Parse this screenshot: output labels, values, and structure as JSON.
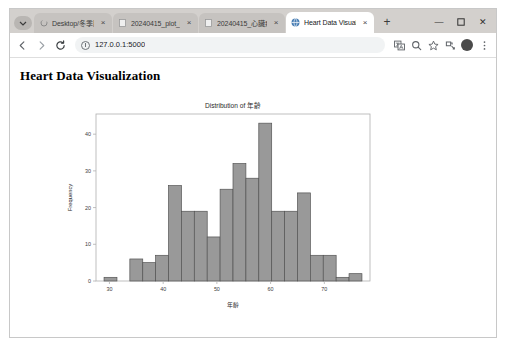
{
  "browser": {
    "tab_search_icon": "chevron-down-icon",
    "tabs": [
      {
        "title": "Desktop/冬季服裝",
        "favicon": "loading-spinner-icon",
        "close": "×",
        "active": false
      },
      {
        "title": "20240415_plot_D",
        "favicon": "file-icon",
        "close": "×",
        "active": false
      },
      {
        "title": "20240415_心臟病",
        "favicon": "file-icon",
        "close": "×",
        "active": false
      },
      {
        "title": "Heart Data Visual",
        "favicon": "globe-icon",
        "close": "×",
        "active": true
      }
    ],
    "new_tab_label": "+",
    "window_controls": {
      "minimize": "—",
      "maximize": "▢",
      "close": "✕"
    },
    "nav": {
      "back": "←",
      "forward": "→",
      "reload": "⟳"
    },
    "omnibox": {
      "url": "127.0.0.1:5000",
      "site_info_icon": "info-circle-icon"
    },
    "toolbar_icons": [
      "translate-icon",
      "search-icon",
      "bookmark-star-icon",
      "extensions-icon",
      "profile-avatar-icon",
      "more-menu-icon"
    ]
  },
  "page": {
    "heading": "Heart Data Visualization"
  },
  "chart_data": {
    "type": "bar",
    "title": "Distribution of 年齡",
    "xlabel": "年齡",
    "ylabel": "Frequency",
    "xlim": [
      27.5,
      78.5
    ],
    "ylim": [
      0,
      45.5
    ],
    "xticks": [
      30,
      40,
      50,
      60,
      70
    ],
    "yticks": [
      0,
      10,
      20,
      30,
      40
    ],
    "grid": false,
    "legend": null,
    "bar_color": "#999999",
    "bar_edge_color": "#545454",
    "bin_edges": [
      29,
      31.4,
      33.8,
      36.2,
      38.6,
      41,
      43.4,
      45.8,
      48.2,
      50.6,
      53,
      55.4,
      57.8,
      60.2,
      62.6,
      65,
      67.4,
      69.8,
      72.2,
      74.6,
      77
    ],
    "categories": [
      "29-31.4",
      "31.4-33.8",
      "33.8-36.2",
      "36.2-38.6",
      "38.6-41",
      "41-43.4",
      "43.4-45.8",
      "45.8-48.2",
      "48.2-50.6",
      "50.6-53",
      "53-55.4",
      "55.4-57.8",
      "57.8-60.2",
      "60.2-62.6",
      "62.6-65",
      "65-67.4",
      "67.4-69.8",
      "69.8-72.2",
      "72.2-74.6",
      "74.6-77"
    ],
    "values": [
      1,
      0,
      6,
      5,
      7,
      26,
      19,
      19,
      12,
      25,
      32,
      28,
      43,
      19,
      19,
      24,
      7,
      7,
      1,
      2
    ]
  }
}
